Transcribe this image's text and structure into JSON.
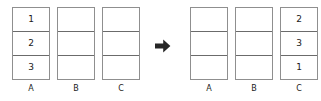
{
  "diagram": {
    "colors": {
      "outer_border": "#8f8f8f",
      "cell_divider": "#6b6b6b",
      "cell_background": "#ffffff",
      "text": "#1a1a1a",
      "arrow": "#262626",
      "page_background": "#ffffff"
    },
    "transition": {
      "icon": "right-arrow-icon",
      "glyph": "➡"
    },
    "before": {
      "stacks": [
        {
          "label": "A",
          "cells": [
            "1",
            "2",
            "3"
          ]
        },
        {
          "label": "B",
          "cells": [
            "",
            "",
            ""
          ]
        },
        {
          "label": "C",
          "cells": [
            "",
            "",
            ""
          ]
        }
      ]
    },
    "after": {
      "stacks": [
        {
          "label": "A",
          "cells": [
            "",
            "",
            ""
          ]
        },
        {
          "label": "B",
          "cells": [
            "",
            "",
            ""
          ]
        },
        {
          "label": "C",
          "cells": [
            "2",
            "3",
            "1"
          ]
        }
      ]
    }
  }
}
